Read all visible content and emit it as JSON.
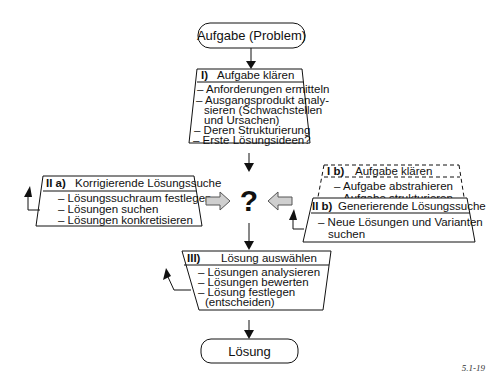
{
  "start": {
    "label": "Aufgabe (Problem)"
  },
  "step1": {
    "number": "I)",
    "title": "Aufgabe klären",
    "items": [
      "– Anforderungen ermitteln",
      "– Ausgangsprodukt analy-",
      "  sieren (Schwachstellen",
      "  und Ursachen)",
      "– Deren Strukturierung",
      "– Erste Lösungsideen?"
    ]
  },
  "step2a": {
    "number": "II a)",
    "title": "Korrigierende Lösungssuche",
    "items": [
      "– Lösungssuchraum festlegen",
      "– Lösungen suchen",
      "– Lösungen konkretisieren"
    ]
  },
  "center": {
    "symbol": "?"
  },
  "step1b": {
    "number": "I b)",
    "title": "Aufgabe klären",
    "items": [
      "– Aufgabe abstrahieren",
      "– Aufgabe strukturieren"
    ]
  },
  "step2b": {
    "number": "II b)",
    "title": "Generierende Lösungssuche",
    "items": [
      "– Neue Lösungen und Varianten",
      "  suchen"
    ]
  },
  "step3": {
    "number": "III)",
    "title": "Lösung auswählen",
    "items": [
      "– Lösungen analysieren",
      "– Lösungen bewerten",
      "– Lösung festlegen",
      "  (entscheiden)"
    ]
  },
  "end": {
    "label": "Lösung"
  },
  "figure_number": "5.1-19",
  "colors": {
    "line": "#111111",
    "hollow_arrow_fill": "#cfcfcf",
    "background": "#ffffff"
  }
}
